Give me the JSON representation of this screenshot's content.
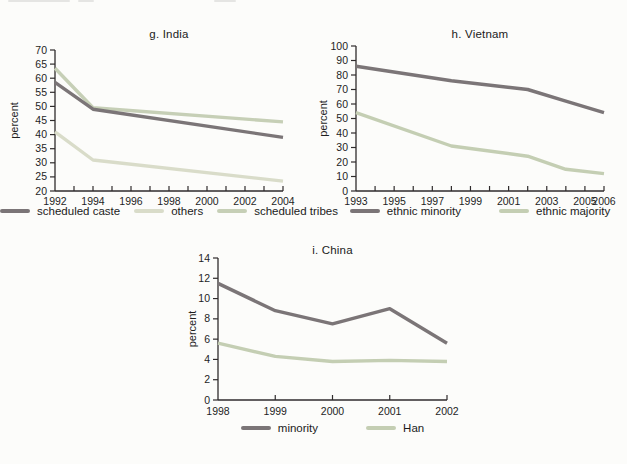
{
  "page": {
    "background": "#fcfcfa",
    "unit_label": "percent"
  },
  "chart_data": [
    {
      "id": "india",
      "type": "line",
      "title": "g. India",
      "ylabel": "percent",
      "ylim": [
        20,
        70
      ],
      "ytick_step": 5,
      "xlim": [
        1992,
        2004
      ],
      "xticks_labeled": [
        1992,
        1994,
        1996,
        1998,
        2000,
        2002,
        2004
      ],
      "xtick_minor_every": 1,
      "grid": false,
      "legend_position": "bottom",
      "draw_order": [
        1,
        2,
        0
      ],
      "series": [
        {
          "name": "scheduled caste",
          "color": "#7b7577",
          "x": [
            1992,
            1994,
            2004
          ],
          "values": [
            58.5,
            49,
            39
          ]
        },
        {
          "name": "others",
          "color": "#d9dcc9",
          "x": [
            1992,
            1994,
            2004
          ],
          "values": [
            41,
            31,
            23.5
          ]
        },
        {
          "name": "scheduled tribes",
          "color": "#c6cfb6",
          "x": [
            1992,
            1994,
            2004
          ],
          "values": [
            63.5,
            49.5,
            44.5
          ]
        }
      ]
    },
    {
      "id": "vietnam",
      "type": "line",
      "title": "h. Vietnam",
      "ylabel": "percent",
      "ylim": [
        0,
        100
      ],
      "ytick_step": 10,
      "xlim": [
        1993,
        2006
      ],
      "xticks_labeled": [
        1993,
        1995,
        1997,
        1999,
        2001,
        2003,
        2005,
        2006
      ],
      "xtick_minor_every": 1,
      "grid": false,
      "legend_position": "bottom",
      "draw_order": [
        0,
        1
      ],
      "series": [
        {
          "name": "ethnic minority",
          "color": "#7b7577",
          "x": [
            1993,
            1998,
            2002,
            2004,
            2006
          ],
          "values": [
            86,
            76,
            70,
            62,
            54
          ]
        },
        {
          "name": "ethnic majority",
          "color": "#c4ceb3",
          "x": [
            1993,
            1998,
            2002,
            2004,
            2006
          ],
          "values": [
            54,
            31,
            24,
            15,
            12
          ]
        }
      ]
    },
    {
      "id": "china",
      "type": "line",
      "title": "i. China",
      "ylabel": "percent",
      "ylim": [
        0,
        14
      ],
      "ytick_step": 2,
      "xlim": [
        1998,
        2002
      ],
      "xticks_labeled": [
        1998,
        1999,
        2000,
        2001,
        2002
      ],
      "xtick_minor_every": 1,
      "grid": false,
      "legend_position": "bottom",
      "draw_order": [
        1,
        0
      ],
      "series": [
        {
          "name": "minority",
          "color": "#7b7577",
          "x": [
            1998,
            1999,
            2000,
            2001,
            2002
          ],
          "values": [
            11.5,
            8.8,
            7.5,
            9,
            5.6
          ]
        },
        {
          "name": "Han",
          "color": "#c4ceb3",
          "x": [
            1998,
            1999,
            2000,
            2001,
            2002
          ],
          "values": [
            5.6,
            4.3,
            3.8,
            3.9,
            3.8
          ]
        }
      ]
    }
  ]
}
